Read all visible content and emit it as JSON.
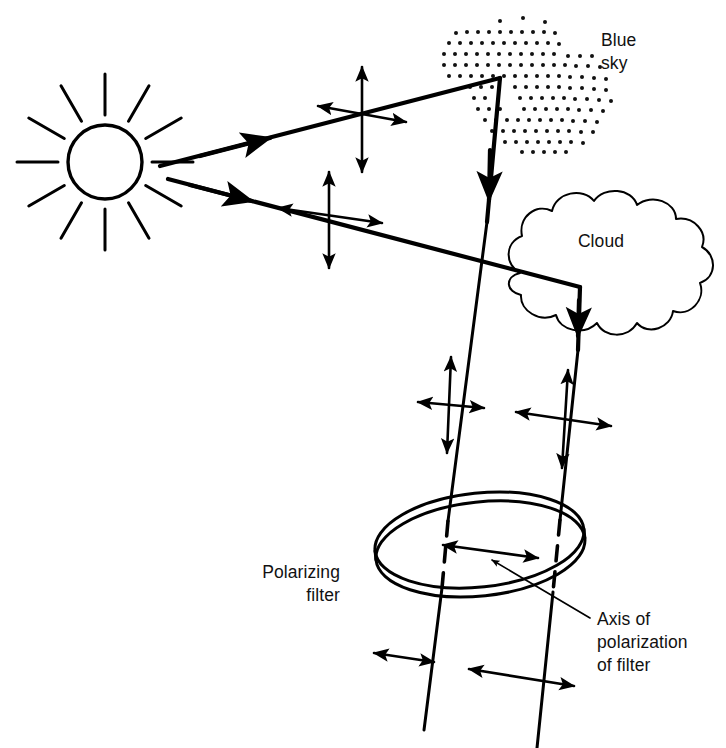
{
  "figure": {
    "background_color": "#ffffff",
    "ink_color": "#000000",
    "width": 726,
    "height": 748
  },
  "labels": {
    "blue_sky_line1": "Blue",
    "blue_sky_line2": "sky",
    "cloud": "Cloud",
    "polarizing_filter_line1": "Polarizing",
    "polarizing_filter_line2": "filter",
    "axis_line1": "Axis of",
    "axis_line2": "polarization",
    "axis_line3": "of filter"
  },
  "objects": {
    "sun": {
      "name": "sun",
      "center_x": 105,
      "center_y": 162,
      "radius": 37,
      "ray_count": 12,
      "ray_inner": 47,
      "ray_outer": 88
    },
    "blue_sky_patch": {
      "name": "blue-sky-dotted-region",
      "dot_spacing": 11,
      "dot_radius": 2.0
    },
    "cloud": {
      "name": "cloud-outline"
    },
    "polarizing_filter": {
      "name": "polarizing-filter-disk",
      "center_x": 480,
      "center_y": 545,
      "radius_x": 107,
      "radius_y": 49,
      "tilt_degrees": -6,
      "thickness": 9
    }
  },
  "ray_paths": {
    "sky_ray": {
      "name": "sunlight-to-blue-sky-ray",
      "description": "Sunlight travels from the sun up to the blue sky where it scatters and is redirected downward through the polarizing filter.",
      "points": "160,166 500,78 440,730"
    },
    "cloud_ray": {
      "name": "sunlight-to-cloud-ray",
      "description": "Sunlight travels from the sun down to the cloud where it scatters and is redirected downward through the polarizing filter.",
      "points": "168,179 580,287 552,748"
    }
  },
  "polarization_marks": [
    {
      "name": "unpolarized-cross-sky-ray",
      "state": "unpolarized",
      "location": "incident sunlight toward blue sky",
      "x": 352,
      "y": 122
    },
    {
      "name": "unpolarized-cross-cloud-ray",
      "state": "unpolarized",
      "location": "incident sunlight toward cloud",
      "x": 327,
      "y": 222
    },
    {
      "name": "unpolarized-cross-scattered-sky-ray",
      "state": "unpolarized",
      "location": "scattered skylight above filter",
      "x": 449,
      "y": 408
    },
    {
      "name": "unpolarized-cross-scattered-cloud-ray",
      "state": "unpolarized",
      "location": "scattered cloud light above filter",
      "x": 563,
      "y": 419
    },
    {
      "name": "axis-of-polarization-arrow",
      "state": "transmission axis",
      "location": "face of polarizing filter",
      "x": 490,
      "y": 551
    },
    {
      "name": "polarized-arrow-sky-ray",
      "state": "linearly polarized",
      "location": "skylight below filter",
      "x": 405,
      "y": 657
    },
    {
      "name": "polarized-arrow-cloud-ray",
      "state": "linearly polarized",
      "location": "cloud light below filter",
      "x": 528,
      "y": 677
    }
  ]
}
